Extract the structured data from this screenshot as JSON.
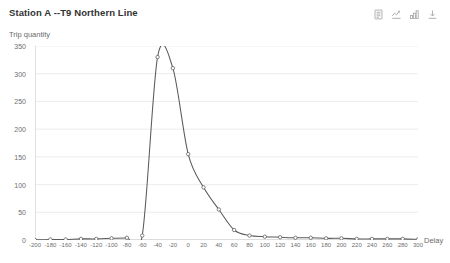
{
  "header": {
    "title": "Station A --T9 Northern Line"
  },
  "toolbox": {
    "items": [
      {
        "name": "data-view-icon",
        "label": "Data view"
      },
      {
        "name": "line-bar-switch-icon",
        "label": "Switch to bar"
      },
      {
        "name": "bar-chart-icon",
        "label": "Bar chart"
      },
      {
        "name": "download-icon",
        "label": "Save as image"
      }
    ]
  },
  "colors": {
    "line": "#5a5a5a",
    "grid": "#e4e4e4",
    "axis": "#b6b6b6",
    "marker_fill": "#ffffff",
    "text": "#6e6e6e",
    "title": "#333333",
    "background": "#ffffff"
  },
  "chart_data": {
    "type": "line",
    "title": "Station A --T9 Northern Line",
    "xlabel": "Delay",
    "ylabel": "Trip quantity",
    "xlim": [
      -200,
      300
    ],
    "ylim": [
      0,
      350
    ],
    "grid": true,
    "legend": "none",
    "y_ticks": [
      0,
      50,
      100,
      150,
      200,
      250,
      300,
      350
    ],
    "x_ticks": [
      -200,
      -180,
      -160,
      -140,
      -120,
      -100,
      -80,
      -60,
      -40,
      -20,
      0,
      20,
      40,
      60,
      80,
      100,
      120,
      140,
      160,
      180,
      200,
      220,
      240,
      260,
      280,
      300
    ],
    "series": [
      {
        "name": "Trip quantity",
        "x": [
          -200,
          -180,
          -160,
          -140,
          -120,
          -100,
          -80,
          -60,
          -40,
          -20,
          0,
          20,
          40,
          60,
          80,
          100,
          120,
          140,
          160,
          180,
          200,
          220,
          240,
          260,
          280,
          300
        ],
        "values": [
          0,
          1,
          1,
          2,
          2,
          3,
          4,
          8,
          330,
          310,
          155,
          95,
          55,
          18,
          8,
          6,
          5,
          4,
          4,
          3,
          3,
          2,
          2,
          2,
          2,
          1
        ]
      }
    ]
  }
}
